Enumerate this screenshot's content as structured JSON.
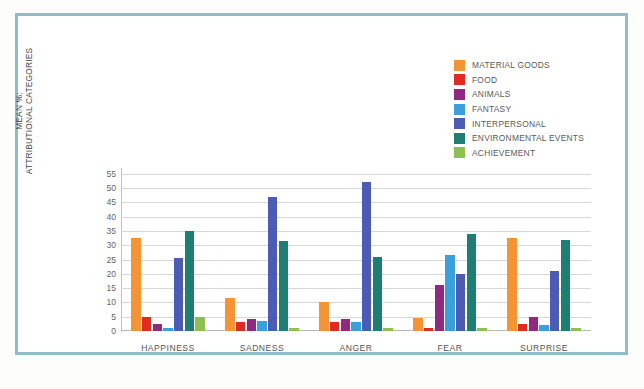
{
  "figure": {
    "frame_color": "#8fbcc6",
    "background": "#ffffff"
  },
  "chart_data": {
    "type": "bar",
    "title": "",
    "xlabel": "",
    "ylabel": "MEAN %: ATTRIBUTIONAL CATEGORIES",
    "ylabel_line1": "MEAN %:",
    "ylabel_line2": "ATTRIBUTIONAL CATEGORIES",
    "ylim": [
      0,
      57
    ],
    "yticks": [
      0,
      5,
      10,
      15,
      20,
      25,
      30,
      35,
      40,
      45,
      50,
      55
    ],
    "grid": true,
    "legend_position": "top-right",
    "categories": [
      "HAPPINESS",
      "SADNESS",
      "ANGER",
      "FEAR",
      "SURPRISE"
    ],
    "series": [
      {
        "name": "MATERIAL GOODS",
        "color": "#f49434",
        "values": [
          32.5,
          11.5,
          10.0,
          4.5,
          32.5
        ]
      },
      {
        "name": "FOOD",
        "color": "#e02b22",
        "values": [
          5.0,
          3.3,
          3.2,
          1.0,
          2.5
        ]
      },
      {
        "name": "ANIMALS",
        "color": "#8f2a80",
        "values": [
          2.5,
          4.3,
          4.2,
          16.0,
          4.8
        ]
      },
      {
        "name": "FANTASY",
        "color": "#3a9fda",
        "values": [
          1.0,
          3.4,
          3.3,
          26.5,
          2.0
        ]
      },
      {
        "name": "INTERPERSONAL",
        "color": "#4c5cb5",
        "values": [
          25.5,
          47.0,
          52.0,
          20.0,
          21.0
        ]
      },
      {
        "name": "ENVIRONMENTAL EVENTS",
        "color": "#1d7f73",
        "values": [
          35.0,
          31.5,
          26.0,
          34.0,
          32.0
        ]
      },
      {
        "name": "ACHIEVEMENT",
        "color": "#8cc152",
        "values": [
          5.0,
          1.2,
          1.2,
          1.1,
          1.1
        ]
      }
    ]
  }
}
